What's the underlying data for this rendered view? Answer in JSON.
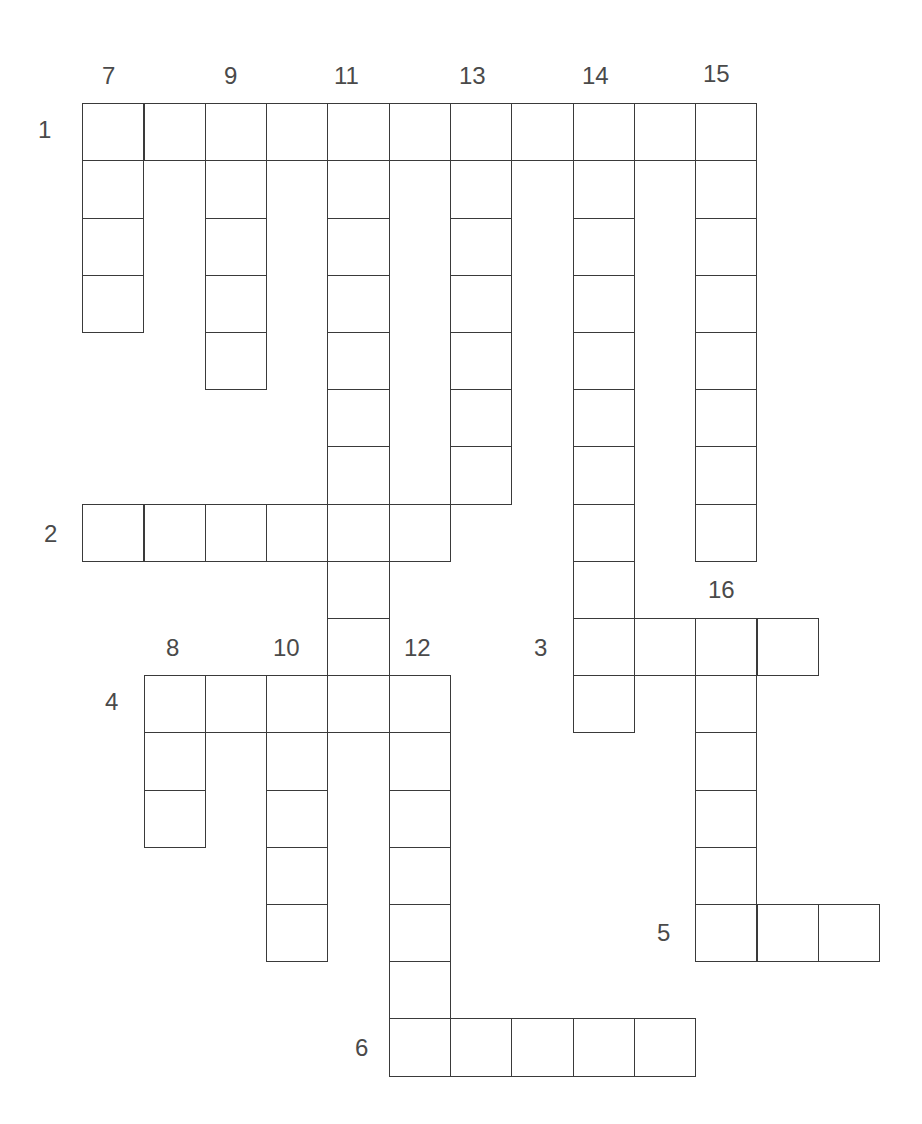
{
  "puzzle": {
    "type": "crossword",
    "layout": {
      "origin_x": 83,
      "origin_y": 104,
      "cell_w": 61.3,
      "cell_h": 57.2
    },
    "border_color": "#3a3a3a",
    "label_color": "#4a4a4a",
    "entries": [
      {
        "number": "1",
        "direction": "across",
        "row": 0,
        "col": 0,
        "length": 11
      },
      {
        "number": "2",
        "direction": "across",
        "row": 7,
        "col": 0,
        "length": 6
      },
      {
        "number": "3",
        "direction": "across",
        "row": 9,
        "col": 8,
        "length": 4
      },
      {
        "number": "4",
        "direction": "across",
        "row": 10,
        "col": 1,
        "length": 5
      },
      {
        "number": "5",
        "direction": "across",
        "row": 14,
        "col": 10,
        "length": 3
      },
      {
        "number": "6",
        "direction": "across",
        "row": 16,
        "col": 5,
        "length": 5
      },
      {
        "number": "7",
        "direction": "down",
        "row": 0,
        "col": 0,
        "length": 4
      },
      {
        "number": "8",
        "direction": "down",
        "row": 10,
        "col": 1,
        "length": 3
      },
      {
        "number": "9",
        "direction": "down",
        "row": 0,
        "col": 2,
        "length": 5
      },
      {
        "number": "10",
        "direction": "down",
        "row": 10,
        "col": 3,
        "length": 5
      },
      {
        "number": "11",
        "direction": "down",
        "row": 0,
        "col": 4,
        "length": 11
      },
      {
        "number": "12",
        "direction": "down",
        "row": 10,
        "col": 5,
        "length": 7
      },
      {
        "number": "13",
        "direction": "down",
        "row": 0,
        "col": 6,
        "length": 7
      },
      {
        "number": "14",
        "direction": "down",
        "row": 0,
        "col": 8,
        "length": 11
      },
      {
        "number": "15",
        "direction": "down",
        "row": 0,
        "col": 10,
        "length": 8
      },
      {
        "number": "16",
        "direction": "down",
        "row": 9,
        "col": 10,
        "length": 6
      }
    ],
    "labels": [
      {
        "text": "1",
        "x": 38,
        "y": 118
      },
      {
        "text": "7",
        "x": 102,
        "y": 64
      },
      {
        "text": "9",
        "x": 224,
        "y": 64
      },
      {
        "text": "11",
        "x": 334,
        "y": 64
      },
      {
        "text": "13",
        "x": 459,
        "y": 64
      },
      {
        "text": "14",
        "x": 582,
        "y": 64
      },
      {
        "text": "15",
        "x": 703,
        "y": 62
      },
      {
        "text": "2",
        "x": 44,
        "y": 522
      },
      {
        "text": "16",
        "x": 708,
        "y": 578
      },
      {
        "text": "3",
        "x": 534,
        "y": 636
      },
      {
        "text": "8",
        "x": 166,
        "y": 636
      },
      {
        "text": "10",
        "x": 273,
        "y": 636
      },
      {
        "text": "12",
        "x": 404,
        "y": 636
      },
      {
        "text": "4",
        "x": 105,
        "y": 690
      },
      {
        "text": "5",
        "x": 657,
        "y": 921
      },
      {
        "text": "6",
        "x": 355,
        "y": 1036
      }
    ]
  }
}
